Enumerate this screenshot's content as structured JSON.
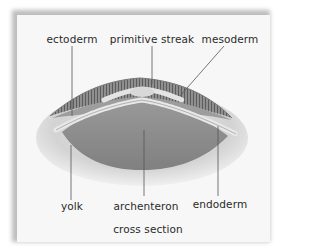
{
  "figure": {
    "caption": "cross section",
    "labels": {
      "ectoderm": "ectoderm",
      "primitive_streak": "primitive streak",
      "mesoderm": "mesoderm",
      "yolk": "yolk",
      "archenteron": "archenteron",
      "endoderm": "endoderm"
    },
    "colors": {
      "card": "#f7f7f7",
      "shadow": "#bdbdbd",
      "yolk": "#d6d6d6",
      "cavity": "#8e8e8e",
      "ectoderm": "#7a7a7a",
      "cells": "#e6e6e6",
      "leader_line": "#555555"
    }
  }
}
